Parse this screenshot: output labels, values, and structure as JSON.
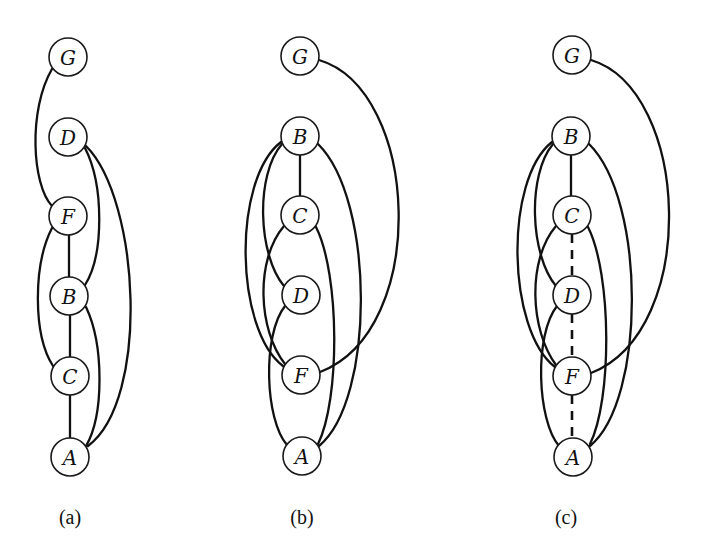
{
  "figure": {
    "panels": [
      {
        "id": "a",
        "caption": "(a)",
        "caption_x": 70,
        "nodes": [
          {
            "label": "G",
            "x": 68,
            "y": 57
          },
          {
            "label": "D",
            "x": 68,
            "y": 137
          },
          {
            "label": "F",
            "x": 68,
            "y": 216
          },
          {
            "label": "B",
            "x": 69,
            "y": 296
          },
          {
            "label": "C",
            "x": 70,
            "y": 376
          },
          {
            "label": "A",
            "x": 70,
            "y": 457
          }
        ],
        "edges": [
          {
            "from": "G",
            "to": "F",
            "style": "solid",
            "path": "M 52 69 C 28 110, 32 185, 52 206"
          },
          {
            "from": "D",
            "to": "B",
            "style": "solid",
            "path": "M 85 148 C 104 185, 104 255, 85 285"
          },
          {
            "from": "D",
            "to": "A",
            "style": "solid",
            "path": "M 86 146 C 140 200, 150 400, 88 446"
          },
          {
            "from": "F",
            "to": "B",
            "style": "solid",
            "path": "M 69 235 L 69 277"
          },
          {
            "from": "F",
            "to": "C",
            "style": "solid",
            "path": "M 52 228 C 33 265, 33 335, 53 366"
          },
          {
            "from": "B",
            "to": "C",
            "style": "solid",
            "path": "M 70 315 L 70 357"
          },
          {
            "from": "B",
            "to": "A",
            "style": "solid",
            "path": "M 86 307 C 104 345, 104 415, 86 446"
          },
          {
            "from": "C",
            "to": "A",
            "style": "solid",
            "path": "M 70 395 L 70 438"
          }
        ]
      },
      {
        "id": "b",
        "caption": "(b)",
        "caption_x": 302,
        "nodes": [
          {
            "label": "G",
            "x": 300,
            "y": 56
          },
          {
            "label": "B",
            "x": 300,
            "y": 136
          },
          {
            "label": "C",
            "x": 300,
            "y": 215
          },
          {
            "label": "D",
            "x": 301,
            "y": 295
          },
          {
            "label": "F",
            "x": 301,
            "y": 375
          },
          {
            "label": "A",
            "x": 302,
            "y": 456
          }
        ],
        "edges": [
          {
            "from": "G",
            "to": "F",
            "style": "solid",
            "path": "M 319 60 C 420 90, 430 330, 320 372"
          },
          {
            "from": "B",
            "to": "C",
            "style": "solid",
            "path": "M 300 155 L 300 196"
          },
          {
            "from": "B",
            "to": "D",
            "style": "solid",
            "path": "M 282 144 C 255 175, 258 255, 284 286"
          },
          {
            "from": "B",
            "to": "F",
            "style": "solid",
            "path": "M 281 142 C 232 180, 235 330, 283 366"
          },
          {
            "from": "B",
            "to": "A",
            "style": "solid",
            "path": "M 318 144 C 375 200, 375 400, 319 446"
          },
          {
            "from": "C",
            "to": "F",
            "style": "solid",
            "path": "M 284 226 C 255 260, 258 330, 285 364"
          },
          {
            "from": "C",
            "to": "A",
            "style": "solid",
            "path": "M 316 227 C 340 275, 340 400, 318 444"
          },
          {
            "from": "D",
            "to": "A",
            "style": "solid",
            "path": "M 285 306 C 262 335, 265 420, 287 445"
          }
        ]
      },
      {
        "id": "c",
        "caption": "(c)",
        "caption_x": 566,
        "nodes": [
          {
            "label": "G",
            "x": 572,
            "y": 55
          },
          {
            "label": "B",
            "x": 571,
            "y": 136
          },
          {
            "label": "C",
            "x": 572,
            "y": 215
          },
          {
            "label": "D",
            "x": 572,
            "y": 295
          },
          {
            "label": "F",
            "x": 572,
            "y": 376
          },
          {
            "label": "A",
            "x": 573,
            "y": 457
          }
        ],
        "edges": [
          {
            "from": "G",
            "to": "F",
            "style": "solid",
            "path": "M 591 60 C 690 90, 700 330, 591 373"
          },
          {
            "from": "B",
            "to": "C",
            "style": "solid",
            "path": "M 571 155 L 571 196"
          },
          {
            "from": "B",
            "to": "D",
            "style": "solid",
            "path": "M 553 144 C 527 175, 530 255, 556 286"
          },
          {
            "from": "B",
            "to": "F",
            "style": "solid",
            "path": "M 552 142 C 504 180, 507 330, 555 367"
          },
          {
            "from": "B",
            "to": "A",
            "style": "solid",
            "path": "M 589 144 C 646 200, 646 400, 590 446"
          },
          {
            "from": "C",
            "to": "F",
            "style": "solid",
            "path": "M 556 226 C 527 260, 530 330, 556 365"
          },
          {
            "from": "C",
            "to": "A",
            "style": "solid",
            "path": "M 588 227 C 612 275, 612 400, 590 444"
          },
          {
            "from": "D",
            "to": "A",
            "style": "solid",
            "path": "M 557 306 C 534 335, 537 420, 559 446"
          },
          {
            "from": "C",
            "to": "D",
            "style": "dashed",
            "path": "M 572 234 L 572 276"
          },
          {
            "from": "D",
            "to": "F",
            "style": "dashed",
            "path": "M 572 314 L 572 357"
          },
          {
            "from": "F",
            "to": "A",
            "style": "dashed",
            "path": "M 572 395 L 572 438"
          }
        ]
      }
    ],
    "node_radius": 19,
    "colors": {
      "stroke": "#111111",
      "background": "#ffffff"
    }
  }
}
